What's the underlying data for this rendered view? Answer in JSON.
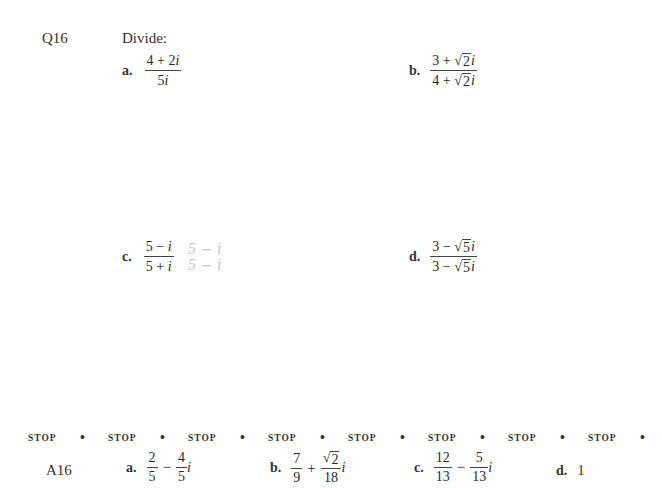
{
  "question": {
    "number": "Q16",
    "instruction": "Divide:",
    "parts": [
      {
        "label": "a.",
        "numerator": "4 + 2i",
        "denominator": "5i"
      },
      {
        "label": "b.",
        "numerator": "3 + √2i",
        "denominator": "4 + √2i"
      },
      {
        "label": "c.",
        "numerator": "5 − i",
        "denominator": "5 + i",
        "handwritten_note": [
          "5 − i",
          "5 − i"
        ]
      },
      {
        "label": "d.",
        "numerator": "3 − √5i",
        "denominator": "3 − √5i"
      }
    ]
  },
  "stop_bar": {
    "word": "STOP",
    "count": 8,
    "separator": "•"
  },
  "answer": {
    "number": "A16",
    "parts": [
      {
        "label": "a.",
        "text": "2/5 − 4/5 i",
        "t1_num": "2",
        "t1_den": "5",
        "op": "−",
        "t2_num": "4",
        "t2_den": "5",
        "suffix": "i"
      },
      {
        "label": "b.",
        "text": "7/9 + √2/18 i",
        "t1_num": "7",
        "t1_den": "9",
        "op": "+",
        "t2_num": "2",
        "t2_den": "18",
        "suffix": "i"
      },
      {
        "label": "c.",
        "text": "12/13 − 5/13 i",
        "t1_num": "12",
        "t1_den": "13",
        "op": "−",
        "t2_num": "5",
        "t2_den": "13",
        "suffix": "i"
      },
      {
        "label": "d.",
        "text": "1"
      }
    ]
  },
  "glyphs": {
    "plus": "+",
    "minus": "−",
    "i": "i",
    "radical": "√",
    "two": "2",
    "three": "3",
    "four": "4",
    "five": "5"
  }
}
